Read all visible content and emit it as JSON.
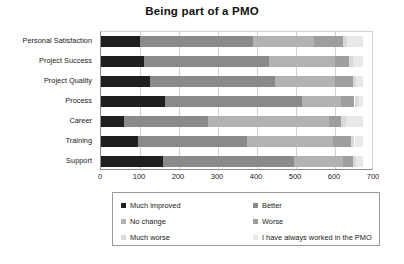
{
  "chart_data": {
    "type": "bar",
    "orientation": "horizontal",
    "stacked": true,
    "title": "Being part of a PMO",
    "xlabel": "",
    "ylabel": "",
    "xlim": [
      0,
      700
    ],
    "xticks": [
      0,
      100,
      200,
      300,
      400,
      500,
      600,
      700
    ],
    "grid": true,
    "legend_position": "bottom",
    "categories": [
      "Personal Satisfaction",
      "Project Success",
      "Project Quality",
      "Process",
      "Career",
      "Training",
      "Support"
    ],
    "series": [
      {
        "name": "Much improved",
        "color": "#1f1f1f",
        "values": [
          100,
          110,
          125,
          165,
          60,
          95,
          160
        ]
      },
      {
        "name": "Better",
        "color": "#8a8a8a",
        "values": [
          290,
          320,
          320,
          350,
          215,
          280,
          335
        ]
      },
      {
        "name": "No change",
        "color": "#b2b2b2",
        "values": [
          155,
          170,
          155,
          100,
          310,
          220,
          125
        ]
      },
      {
        "name": "Worse",
        "color": "#9e9e9e",
        "values": [
          75,
          35,
          45,
          35,
          30,
          45,
          25
        ]
      },
      {
        "name": "Much worse",
        "color": "#d9d9d9",
        "values": [
          12,
          10,
          10,
          8,
          12,
          10,
          8
        ]
      },
      {
        "name": "I have always worked in the PMO",
        "color": "#e8e8e8",
        "values": [
          40,
          27,
          17,
          14,
          45,
          22,
          19
        ]
      }
    ]
  },
  "legend": {
    "items": [
      {
        "label": "Much improved",
        "color": "#1f1f1f"
      },
      {
        "label": "Better",
        "color": "#8a8a8a"
      },
      {
        "label": "No change",
        "color": "#b2b2b2"
      },
      {
        "label": "Worse",
        "color": "#9e9e9e"
      },
      {
        "label": "Much worse",
        "color": "#d9d9d9"
      },
      {
        "label": "I have always worked in the PMO",
        "color": "#e8e8e8"
      }
    ]
  }
}
